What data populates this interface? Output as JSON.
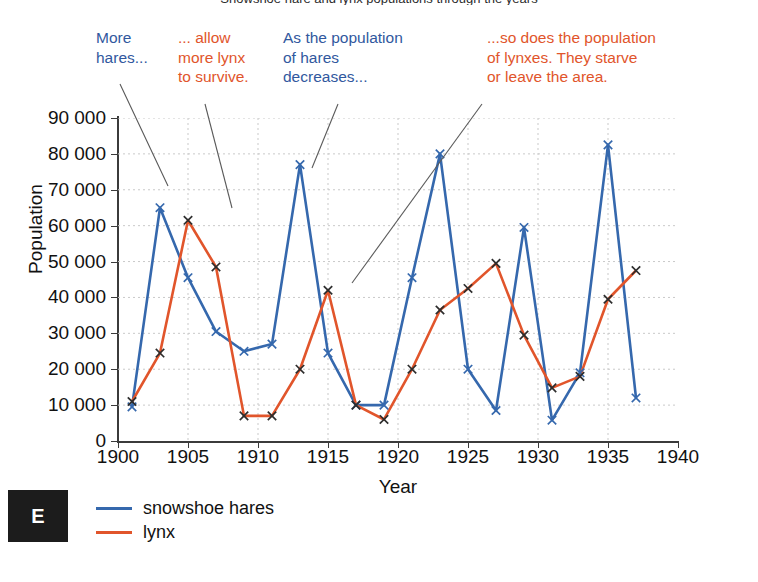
{
  "title": "Snowshoe hare and lynx populations through the years",
  "axes": {
    "ylabel": "Population",
    "xlabel": "Year",
    "yticks": [
      "0",
      "10 000",
      "20 000",
      "30 000",
      "40 000",
      "50 000",
      "60 000",
      "70 000",
      "80 000",
      "90 000"
    ],
    "xticks": [
      "1900",
      "1905",
      "1910",
      "1915",
      "1920",
      "1925",
      "1930",
      "1935",
      "1940"
    ]
  },
  "legend": {
    "items": [
      {
        "label": "snowshoe hares",
        "color": "#3568ad"
      },
      {
        "label": "lynx",
        "color": "#e1552b"
      }
    ]
  },
  "badge": {
    "letter": "E"
  },
  "annotations": [
    {
      "id": "more-hares",
      "text": "More\nhares...",
      "color": "#31589e",
      "x": 96,
      "y": 28
    },
    {
      "id": "allow-more-lynx",
      "text": "... allow\nmore lynx\nto survive.",
      "color": "#e1552b",
      "x": 178,
      "y": 28
    },
    {
      "id": "hares-decrease",
      "text": "As the population\nof hares\ndecreases...",
      "color": "#31589e",
      "x": 283,
      "y": 28
    },
    {
      "id": "lynx-starve",
      "text": "...so does the population\nof lynxes. They starve\nor leave the area.",
      "color": "#e1552b",
      "x": 487,
      "y": 28
    }
  ],
  "chart_data": {
    "type": "line",
    "title": "Snowshoe hare and lynx populations through the years",
    "xlabel": "Year",
    "ylabel": "Population",
    "xlim": [
      1900,
      1940
    ],
    "ylim": [
      0,
      90000
    ],
    "xtick_step": 5,
    "ytick_step": 10000,
    "grid": true,
    "legend_position": "bottom-left",
    "marker": "x",
    "x": [
      1901,
      1903,
      1905,
      1907,
      1909,
      1911,
      1913,
      1915,
      1917,
      1919,
      1921,
      1923,
      1925,
      1927,
      1929,
      1931,
      1933,
      1935,
      1937
    ],
    "series": [
      {
        "name": "snowshoe hares",
        "color": "#3568ad",
        "values": [
          9500,
          65000,
          45500,
          30500,
          25000,
          27000,
          77000,
          24500,
          10000,
          10000,
          45500,
          80000,
          20000,
          8500,
          59500,
          5800,
          19000,
          82500,
          12000
        ]
      },
      {
        "name": "lynx",
        "color": "#e1552b",
        "values": [
          11000,
          24500,
          61500,
          48500,
          7000,
          7000,
          20000,
          42000,
          10000,
          6000,
          20000,
          36500,
          42500,
          49500,
          29500,
          14800,
          18000,
          39500,
          47500
        ]
      }
    ]
  }
}
